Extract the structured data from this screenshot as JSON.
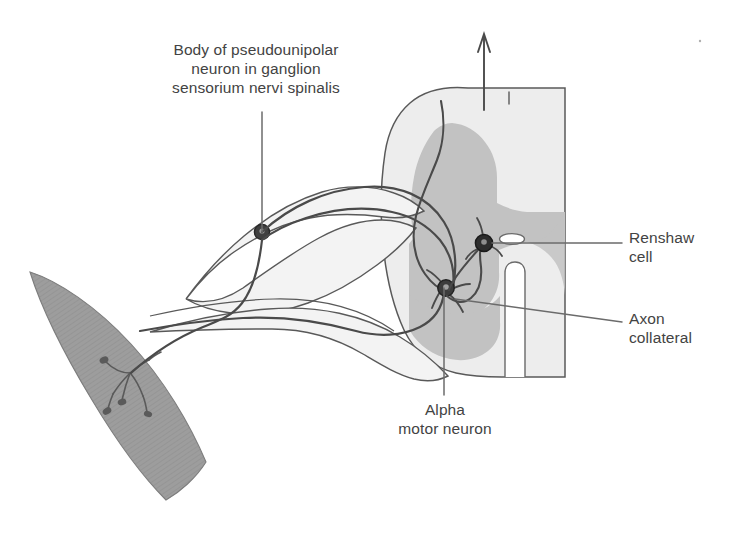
{
  "figure": {
    "type": "anatomical-diagram"
  },
  "labels": {
    "ganglion_neuron": "Body of pseudounipolar\nneuron in ganglion\nsensorium nervi spinalis",
    "renshaw_cell": "Renshaw\ncell",
    "axon_collateral": "Axon\ncollateral",
    "alpha_motor_neuron": "Alpha\nmotor neuron"
  },
  "structures": {
    "muscle": "skeletal-muscle-spindle",
    "spinal_cord": "spinal-cord-cross-section",
    "gray_matter": "gray-matter-butterfly",
    "white_matter": "white-matter",
    "central_canal": "central-canal",
    "ventral_median_fissure": "ventral-median-fissure",
    "dorsal_median_sulcus": "dorsal-median-sulcus",
    "dorsal_root_ganglion": "dorsal-root-ganglion",
    "dorsal_root": "dorsal-root",
    "ventral_root": "ventral-root",
    "ascending_arrow": "ascending-tract-arrow",
    "motor_end_plates": "motor-end-plates"
  },
  "colors": {
    "background": "#ffffff",
    "text": "#434343",
    "outline": "#595959",
    "gray_matter": "#c2c2c2",
    "white_matter": "#ededed",
    "muscle": "#9d9d9d",
    "nerve_sheath": "#f0f0f0",
    "cell_body": "#2b2b2b",
    "leader_line": "#6b6b6b"
  }
}
